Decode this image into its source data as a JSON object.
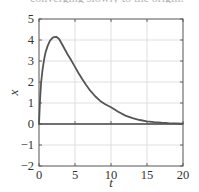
{
  "cropped_caption": "converging slowly to the origin.",
  "chart_data": {
    "type": "line",
    "title": "",
    "xlabel": "t",
    "ylabel": "x",
    "xlim": [
      0,
      20
    ],
    "ylim": [
      -2,
      5
    ],
    "xticks": [
      0,
      5,
      10,
      15,
      20
    ],
    "yticks": [
      -2,
      -1,
      0,
      1,
      2,
      3,
      4,
      5
    ],
    "grid": true,
    "legend": null,
    "zero_line": true,
    "series": [
      {
        "name": "x(t)",
        "color": "#555555",
        "x": [
          0,
          0.15,
          0.3,
          0.5,
          0.7,
          0.9,
          1.2,
          1.5,
          1.8,
          2.1,
          2.4,
          2.8,
          3.2,
          3.6,
          4.0,
          4.5,
          5.0,
          5.5,
          6.0,
          6.5,
          7.0,
          7.8,
          8.5,
          9.2,
          10.0,
          11.0,
          12.0,
          13.0,
          14.0,
          15.0,
          16.0,
          17.0,
          18.0,
          19.0,
          20.0
        ],
        "values": [
          0,
          1.2,
          2.0,
          2.6,
          3.05,
          3.4,
          3.72,
          3.95,
          4.08,
          4.14,
          4.15,
          4.05,
          3.8,
          3.55,
          3.3,
          3.02,
          2.72,
          2.42,
          2.14,
          1.88,
          1.64,
          1.32,
          1.1,
          0.94,
          0.8,
          0.58,
          0.4,
          0.28,
          0.19,
          0.13,
          0.09,
          0.06,
          0.04,
          0.03,
          0.02
        ]
      }
    ]
  }
}
